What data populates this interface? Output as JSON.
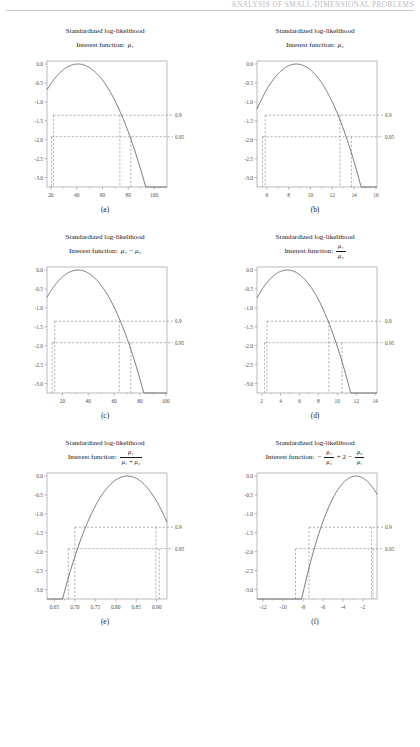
{
  "header": {
    "running_head": "ANALYSIS OF SMALL-DIMENSIONAL PROBLEMS",
    "folio": ""
  },
  "figure": {
    "title_line1": "Standardized log-likelihood",
    "interest_prefix": "Interest function:",
    "confidence_labels": [
      "0.9",
      "0.95"
    ],
    "y_ticks": [
      "0.0",
      "-0.5",
      "-1.0",
      "-1.5",
      "-2.0",
      "-2.5",
      "-3.0"
    ],
    "panels": [
      {
        "caption": "(a)",
        "interest_kind": "plain",
        "interest_text": "μ₁",
        "chart_data": {
          "type": "line",
          "title": "Standardized log-likelihood",
          "subtitle": "Interest function: μ1",
          "xlabel": "",
          "ylabel": "",
          "xlim": [
            17,
            110
          ],
          "ylim": [
            -3.25,
            0.08
          ],
          "xticks": [
            20,
            40,
            60,
            80,
            100
          ],
          "yticks": [
            0.0,
            -0.5,
            -1.0,
            -1.5,
            -2.0,
            -2.5,
            -3.0
          ],
          "grid": false,
          "mle": 41,
          "curvature": 0.00118,
          "right_axis_labels": [
            {
              "label": "0.9",
              "y": -1.353
            },
            {
              "label": "0.95",
              "y": -1.921
            }
          ],
          "interval_90": [
            22.0,
            73.5
          ],
          "interval_95": [
            20.5,
            82.0
          ],
          "series": [
            {
              "name": "standardized log-likelihood",
              "values": []
            }
          ]
        }
      },
      {
        "caption": "(b)",
        "interest_kind": "plain",
        "interest_text": "μ₂",
        "chart_data": {
          "type": "line",
          "title": "Standardized log-likelihood",
          "subtitle": "Interest function: μ2",
          "xlabel": "",
          "ylabel": "",
          "xlim": [
            5.1,
            16.1
          ],
          "ylim": [
            -3.25,
            0.08
          ],
          "xticks": [
            6,
            8,
            10,
            12,
            14,
            16
          ],
          "yticks": [
            0.0,
            -0.5,
            -1.0,
            -1.5,
            -2.0,
            -2.5,
            -3.0
          ],
          "grid": false,
          "mle": 8.7,
          "curvature": 0.092,
          "right_axis_labels": [
            {
              "label": "0.9",
              "y": -1.353
            },
            {
              "label": "0.95",
              "y": -1.921
            }
          ],
          "interval_90": [
            5.85,
            12.7
          ],
          "interval_95": [
            5.6,
            13.75
          ],
          "series": [
            {
              "name": "standardized log-likelihood",
              "values": []
            }
          ]
        }
      },
      {
        "caption": "(c)",
        "interest_kind": "plain",
        "interest_text": "μ₁ − μ₂",
        "chart_data": {
          "type": "line",
          "title": "Standardized log-likelihood",
          "subtitle": "Interest function: μ1 - μ2",
          "xlabel": "",
          "ylabel": "",
          "xlim": [
            8,
            101
          ],
          "ylim": [
            -3.25,
            0.08
          ],
          "xticks": [
            20,
            40,
            60,
            80,
            100
          ],
          "yticks": [
            0.0,
            -0.5,
            -1.0,
            -1.5,
            -2.0,
            -2.5,
            -3.0
          ],
          "grid": false,
          "mle": 32,
          "curvature": 0.00125,
          "right_axis_labels": [
            {
              "label": "0.9",
              "y": -1.353
            },
            {
              "label": "0.95",
              "y": -1.921
            }
          ],
          "interval_90": [
            14.0,
            64.0
          ],
          "interval_95": [
            12.0,
            73.0
          ],
          "series": [
            {
              "name": "standardized log-likelihood",
              "values": []
            }
          ]
        }
      },
      {
        "caption": "(d)",
        "interest_kind": "fraction",
        "interest_num": "μ₁",
        "interest_den": "μ₂",
        "chart_data": {
          "type": "line",
          "title": "Standardized log-likelihood",
          "subtitle": "Interest function: μ1 / μ2",
          "xlabel": "",
          "ylabel": "",
          "xlim": [
            1.5,
            14.2
          ],
          "ylim": [
            -3.25,
            0.08
          ],
          "xticks": [
            2,
            4,
            6,
            8,
            10,
            12,
            14
          ],
          "yticks": [
            0.0,
            -0.5,
            -1.0,
            -1.5,
            -2.0,
            -2.5,
            -3.0
          ],
          "grid": false,
          "mle": 4.7,
          "curvature": 0.072,
          "right_axis_labels": [
            {
              "label": "0.9",
              "y": -1.353
            },
            {
              "label": "0.95",
              "y": -1.921
            }
          ],
          "interval_90": [
            2.55,
            9.1
          ],
          "interval_95": [
            2.3,
            10.5
          ],
          "series": [
            {
              "name": "standardized log-likelihood",
              "values": []
            }
          ]
        }
      },
      {
        "caption": "(e)",
        "interest_kind": "fraction",
        "interest_num": "μ₁",
        "interest_den": "μ₁ + μ₂",
        "chart_data": {
          "type": "line",
          "title": "Standardized log-likelihood",
          "subtitle": "Interest function: μ1 / (μ1 + μ2)",
          "xlabel": "",
          "ylabel": "",
          "xlim": [
            0.632,
            0.925
          ],
          "ylim": [
            -3.25,
            0.08
          ],
          "xticks": [
            0.65,
            0.7,
            0.75,
            0.8,
            0.85,
            0.9
          ],
          "xticklabels": [
            "0.65",
            "0.70",
            "0.75",
            "0.80",
            "0.85",
            "0.90"
          ],
          "yticks": [
            0.0,
            -0.5,
            -1.0,
            -1.5,
            -2.0,
            -2.5,
            -3.0
          ],
          "grid": false,
          "mle": 0.828,
          "curvature": 130.0,
          "right_axis_labels": [
            {
              "label": "0.9",
              "y": -1.353
            },
            {
              "label": "0.95",
              "y": -1.921
            }
          ],
          "interval_90": [
            0.7,
            0.898
          ],
          "interval_95": [
            0.684,
            0.906
          ],
          "series": [
            {
              "name": "standardized log-likelihood",
              "values": []
            }
          ]
        }
      },
      {
        "caption": "(f)",
        "interest_kind": "expr_f",
        "interest_text": "−μ₁/μ₂ + 2 − μ₂/μ₁",
        "chart_data": {
          "type": "line",
          "title": "Standardized log-likelihood",
          "subtitle": "Interest function: -μ1/μ2 + 2 - μ2/μ1",
          "xlabel": "",
          "ylabel": "",
          "xlim": [
            -12.6,
            -0.6
          ],
          "ylim": [
            -3.25,
            0.08
          ],
          "xticks": [
            -12,
            -10,
            -8,
            -6,
            -4,
            -2
          ],
          "yticks": [
            0.0,
            -0.5,
            -1.0,
            -1.5,
            -2.0,
            -2.5,
            -3.0
          ],
          "grid": false,
          "mle": -2.7,
          "curvature": 0.11,
          "right_axis_labels": [
            {
              "label": "0.9",
              "y": -1.353
            },
            {
              "label": "0.95",
              "y": -1.921
            }
          ],
          "interval_90": [
            -7.4,
            -1.15
          ],
          "interval_95": [
            -8.75,
            -1.0
          ],
          "series": [
            {
              "name": "standardized log-likelihood",
              "values": []
            }
          ]
        }
      }
    ]
  }
}
